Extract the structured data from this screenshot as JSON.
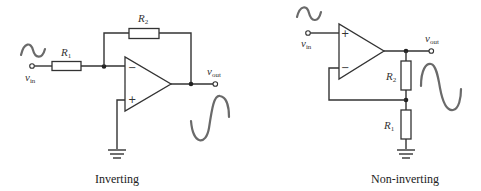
{
  "figure": {
    "inverting": {
      "caption": "Inverting",
      "input_label": "v",
      "input_sub": "in",
      "output_label": "v",
      "output_sub": "out",
      "resistor_r1": {
        "symbol": "R",
        "sub": "1"
      },
      "resistor_r2": {
        "symbol": "R",
        "sub": "2"
      },
      "opamp_minus": "−",
      "opamp_plus": "+"
    },
    "non_inverting": {
      "caption": "Non-inverting",
      "input_label": "v",
      "input_sub": "in",
      "output_label": "v",
      "output_sub": "out",
      "resistor_r1": {
        "symbol": "R",
        "sub": "1"
      },
      "resistor_r2": {
        "symbol": "R",
        "sub": "2"
      },
      "opamp_minus": "−",
      "opamp_plus": "+"
    },
    "colors": {
      "wire": "#333333",
      "waveform": "#6a6a6a",
      "background": "#ffffff"
    }
  }
}
